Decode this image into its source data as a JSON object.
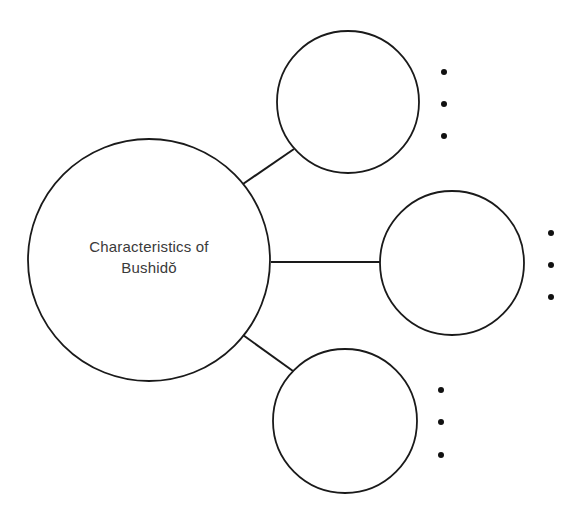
{
  "diagram": {
    "type": "bubble-map",
    "center": {
      "label_line1": "Characteristics of",
      "label_line2": "Bushidŏ",
      "cx": 149,
      "cy": 260,
      "r": 121
    },
    "branches": [
      {
        "id": "top",
        "cx": 348,
        "cy": 102,
        "r": 71,
        "text": "",
        "connector": [
          243,
          184,
          294,
          149
        ],
        "bullets": [
          {
            "x": 444,
            "y": 72
          },
          {
            "x": 444,
            "y": 104
          },
          {
            "x": 444,
            "y": 136
          }
        ]
      },
      {
        "id": "middle",
        "cx": 452,
        "cy": 263,
        "r": 72,
        "text": "",
        "connector": [
          271,
          262,
          380,
          262
        ],
        "bullets": [
          {
            "x": 551,
            "y": 233
          },
          {
            "x": 551,
            "y": 265
          },
          {
            "x": 551,
            "y": 297
          }
        ]
      },
      {
        "id": "bottom",
        "cx": 345,
        "cy": 421,
        "r": 72,
        "text": "",
        "connector": [
          243,
          335,
          293,
          371
        ],
        "bullets": [
          {
            "x": 441,
            "y": 390
          },
          {
            "x": 441,
            "y": 422
          },
          {
            "x": 441,
            "y": 455
          }
        ]
      }
    ],
    "colors": {
      "stroke": "#1a1a1a",
      "text": "#3a3a3a",
      "background": "#ffffff"
    }
  }
}
